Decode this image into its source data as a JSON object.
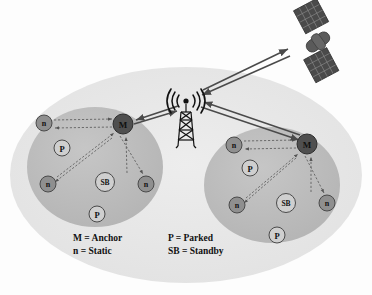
{
  "diagram": {
    "canvas": {
      "width": 372,
      "height": 295,
      "background": "#fdfdfd"
    }
  },
  "colors": {
    "outer_ellipse": "#e8e8e8",
    "cluster_ellipse": "#bdbdbd",
    "anchor_node": "#4f4f4f",
    "static_node": "#8f8f8f",
    "parked_node": "#cfcfcf",
    "standby_node": "#cfcfcf",
    "node_stroke": "#4a4a4a",
    "arrow_solid": "#4a4a4a",
    "arrow_dashed": "#555555",
    "tower": "#111111",
    "satellite_body": "#5a5a5a",
    "satellite_panel": "#4a4a4a",
    "text": "#111111"
  },
  "legend": {
    "name": "node-type-legend",
    "entries": [
      {
        "symbol": "M",
        "separator": "=",
        "meaning": "Anchor",
        "text": "M = Anchor"
      },
      {
        "symbol": "n",
        "separator": "=",
        "meaning": "Static",
        "text": "n = Static"
      },
      {
        "symbol": "P",
        "separator": "=",
        "meaning": "Parked",
        "text": "P = Parked"
      },
      {
        "symbol": "SB",
        "separator": "=",
        "meaning": "Standby",
        "text": "SB = Standby"
      }
    ]
  },
  "infrastructure": {
    "tower": {
      "label": "cell-tower",
      "x": 190,
      "y": 118,
      "waves": "((( o )))"
    },
    "satellite": {
      "label": "satellite",
      "x": 318,
      "y": 42
    }
  },
  "clusters": [
    {
      "id": "cluster-left",
      "center": {
        "x": 95,
        "y": 167
      },
      "radius": {
        "rx": 68,
        "ry": 60
      },
      "nodes": [
        {
          "id": "left-anchor",
          "type": "anchor",
          "label": "M",
          "x": 123,
          "y": 124,
          "r": 10
        },
        {
          "id": "left-static-1",
          "type": "static",
          "label": "n",
          "x": 44,
          "y": 123,
          "r": 8
        },
        {
          "id": "left-static-2",
          "type": "static",
          "label": "n",
          "x": 48,
          "y": 184,
          "r": 8
        },
        {
          "id": "left-static-3",
          "type": "static",
          "label": "n",
          "x": 146,
          "y": 184,
          "r": 8
        },
        {
          "id": "left-parked-1",
          "type": "parked",
          "label": "P",
          "x": 62,
          "y": 148,
          "r": 8
        },
        {
          "id": "left-parked-2",
          "type": "parked",
          "label": "P",
          "x": 97,
          "y": 214,
          "r": 8
        },
        {
          "id": "left-standby",
          "type": "standby",
          "label": "SB",
          "x": 105,
          "y": 182,
          "r": 9
        }
      ],
      "links": [
        {
          "from": "left-static-1",
          "to": "left-anchor",
          "style": "dashed",
          "bidirectional": true
        },
        {
          "from": "left-static-2",
          "to": "left-anchor",
          "style": "dashed",
          "bidirectional": true
        },
        {
          "from": "left-anchor",
          "to": "left-static-3",
          "style": "dashed",
          "bidirectional": true
        }
      ]
    },
    {
      "id": "cluster-right",
      "center": {
        "x": 272,
        "y": 185
      },
      "radius": {
        "rx": 68,
        "ry": 58
      },
      "nodes": [
        {
          "id": "right-anchor",
          "type": "anchor",
          "label": "M",
          "x": 307,
          "y": 144,
          "r": 10
        },
        {
          "id": "right-static-1",
          "type": "static",
          "label": "n",
          "x": 234,
          "y": 145,
          "r": 8
        },
        {
          "id": "right-static-2",
          "type": "static",
          "label": "n",
          "x": 237,
          "y": 205,
          "r": 8
        },
        {
          "id": "right-static-3",
          "type": "static",
          "label": "n",
          "x": 327,
          "y": 203,
          "r": 8
        },
        {
          "id": "right-parked-1",
          "type": "parked",
          "label": "P",
          "x": 250,
          "y": 168,
          "r": 8
        },
        {
          "id": "right-parked-2",
          "type": "parked",
          "label": "P",
          "x": 277,
          "y": 235,
          "r": 8
        },
        {
          "id": "right-standby",
          "type": "standby",
          "label": "SB",
          "x": 286,
          "y": 203,
          "r": 9
        }
      ],
      "links": [
        {
          "from": "right-static-1",
          "to": "right-anchor",
          "style": "dashed",
          "bidirectional": true
        },
        {
          "from": "right-static-2",
          "to": "right-anchor",
          "style": "dashed",
          "bidirectional": true
        },
        {
          "from": "right-anchor",
          "to": "right-static-3",
          "style": "dashed",
          "bidirectional": true
        }
      ]
    }
  ],
  "backhaul_links": [
    {
      "id": "tower-to-left-anchor",
      "from": "cell-tower",
      "to": "left-anchor",
      "style": "solid",
      "bidirectional": true
    },
    {
      "id": "tower-to-right-anchor",
      "from": "cell-tower",
      "to": "right-anchor",
      "style": "solid",
      "bidirectional": true
    },
    {
      "id": "tower-to-satellite",
      "from": "cell-tower",
      "to": "satellite",
      "style": "solid",
      "bidirectional": true
    }
  ]
}
